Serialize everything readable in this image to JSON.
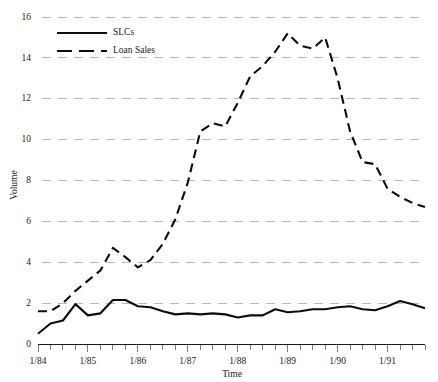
{
  "chart_data": {
    "type": "line",
    "title": "",
    "xlabel": "Time",
    "ylabel": "Volume",
    "ylim": [
      0,
      16
    ],
    "yticks": [
      0,
      2,
      4,
      6,
      8,
      10,
      12,
      14,
      16
    ],
    "xlim": [
      1984.0,
      1991.75
    ],
    "xticks": [
      1984,
      1985,
      1986,
      1987,
      1988,
      1989,
      1990,
      1991
    ],
    "xtick_labels": [
      "1/84",
      "1/85",
      "1/86",
      "1/87",
      "1/88",
      "1/89",
      "1/90",
      "1/91"
    ],
    "minor_tick_interval_years": 0.25,
    "grid": true,
    "grid_axis": "y",
    "legend_position": "top-left",
    "x": [
      1984.0,
      1984.25,
      1984.5,
      1984.75,
      1985.0,
      1985.25,
      1985.5,
      1985.75,
      1986.0,
      1986.25,
      1986.5,
      1986.75,
      1987.0,
      1987.25,
      1987.5,
      1987.75,
      1988.0,
      1988.25,
      1988.5,
      1988.75,
      1989.0,
      1989.25,
      1989.5,
      1989.75,
      1990.0,
      1990.25,
      1990.5,
      1990.75,
      1991.0,
      1991.25,
      1991.5,
      1991.75
    ],
    "series": [
      {
        "name": "SLCs",
        "style": "solid",
        "color": "#0d0d0d",
        "values": [
          0.5,
          1.0,
          1.15,
          1.95,
          1.4,
          1.5,
          2.15,
          2.15,
          1.85,
          1.8,
          1.6,
          1.45,
          1.5,
          1.45,
          1.5,
          1.45,
          1.3,
          1.4,
          1.4,
          1.7,
          1.55,
          1.6,
          1.7,
          1.7,
          1.8,
          1.85,
          1.7,
          1.65,
          1.85,
          2.1,
          1.95,
          1.75
        ]
      },
      {
        "name": "Loan Sales",
        "style": "dashed",
        "color": "#0d0d0d",
        "values": [
          1.6,
          1.6,
          2.0,
          2.6,
          3.1,
          3.6,
          4.7,
          4.25,
          3.75,
          4.1,
          4.9,
          6.1,
          7.9,
          10.4,
          10.8,
          10.65,
          11.8,
          13.1,
          13.6,
          14.3,
          15.2,
          14.6,
          14.45,
          15.0,
          13.0,
          10.4,
          8.9,
          8.8,
          7.6,
          7.2,
          6.9,
          6.7
        ]
      }
    ],
    "legend": [
      {
        "label": "SLCs",
        "style": "solid"
      },
      {
        "label": "Loan Sales",
        "style": "dashed"
      }
    ]
  }
}
